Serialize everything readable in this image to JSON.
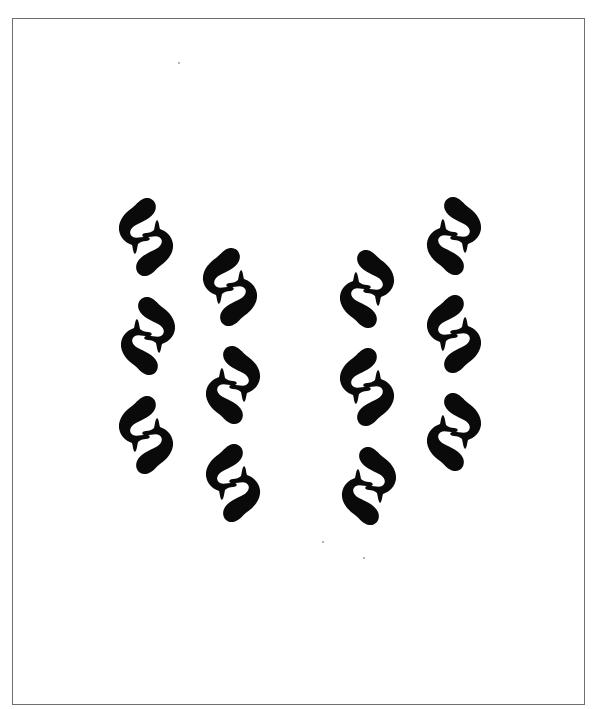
{
  "artwork": {
    "description": "Twelve pairs of stylized fish arranged in four vertical columns",
    "ink_color": "#0a0a0a",
    "background_color": "#ffffff",
    "border_color": "#6f6f6f",
    "frame": {
      "left": 12,
      "top": 18,
      "right": 585,
      "bottom": 705
    },
    "columns": [
      {
        "name": "column-1",
        "pairs": [
          {
            "x": 116,
            "y": 196,
            "variant": "A"
          },
          {
            "x": 118,
            "y": 295,
            "variant": "B"
          },
          {
            "x": 116,
            "y": 394,
            "variant": "A"
          }
        ]
      },
      {
        "name": "column-2",
        "pairs": [
          {
            "x": 200,
            "y": 246,
            "variant": "A"
          },
          {
            "x": 203,
            "y": 344,
            "variant": "B"
          },
          {
            "x": 203,
            "y": 442,
            "variant": "A"
          }
        ]
      },
      {
        "name": "column-3",
        "pairs": [
          {
            "x": 337,
            "y": 248,
            "variant": "B"
          },
          {
            "x": 337,
            "y": 346,
            "variant": "A"
          },
          {
            "x": 339,
            "y": 445,
            "variant": "B"
          }
        ]
      },
      {
        "name": "column-4",
        "pairs": [
          {
            "x": 424,
            "y": 195,
            "variant": "B"
          },
          {
            "x": 424,
            "y": 293,
            "variant": "A"
          },
          {
            "x": 424,
            "y": 391,
            "variant": "B"
          }
        ]
      }
    ],
    "specks": [
      {
        "x": 178,
        "y": 62
      },
      {
        "x": 322,
        "y": 541
      },
      {
        "x": 363,
        "y": 557
      }
    ]
  }
}
